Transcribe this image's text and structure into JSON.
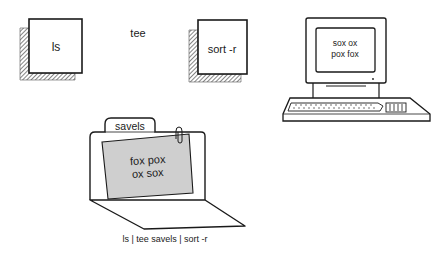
{
  "diagram": {
    "commands": {
      "ls": {
        "label": "ls"
      },
      "tee": {
        "label": "tee"
      },
      "sort": {
        "label": "sort -r"
      }
    },
    "terminal": {
      "screen_lines": [
        "sox ox",
        "pox fox"
      ]
    },
    "folder": {
      "tab_label": "savels",
      "paper_lines": [
        "fox pox",
        "ox sox"
      ]
    },
    "caption": "ls | tee savels | sort -r"
  },
  "colors": {
    "ink": "#1a1a1a",
    "paper_fill": "#cfcfcf",
    "background": "#ffffff"
  }
}
